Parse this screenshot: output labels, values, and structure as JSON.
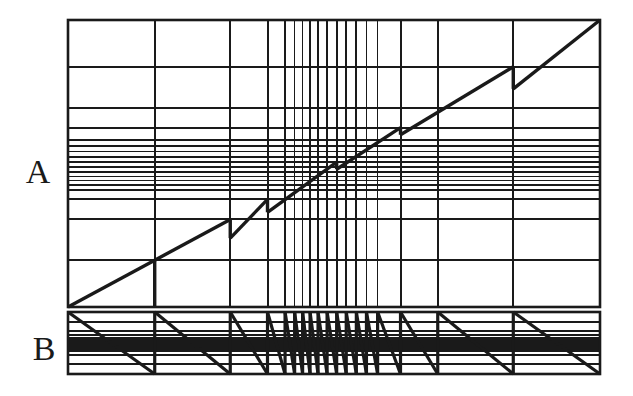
{
  "figure": {
    "background_color": "#ffffff",
    "line_color": "#1a1a1a",
    "canvas": {
      "width": 633,
      "height": 396
    }
  },
  "panels": [
    {
      "id": "A",
      "label": "A",
      "label_x": 38,
      "label_y": 175,
      "box": {
        "x": 68,
        "y": 20,
        "width": 532,
        "height": 287
      },
      "curve_type": "staircase-diagonal",
      "description": "Rising diagonal from lower-left to upper-right broken into segments by vertical drops"
    },
    {
      "id": "B",
      "label": "B",
      "label_x": 44,
      "label_y": 352,
      "box": {
        "x": 68,
        "y": 312,
        "width": 532,
        "height": 62
      },
      "curve_type": "sawtooth",
      "description": "Descending sawtooth ramps with self-similar clustering toward the centre"
    }
  ],
  "chart_data": {
    "type": "line",
    "title": "",
    "xlabel": "",
    "ylabel": "",
    "grid": true,
    "legend": "none",
    "xlim": [
      0,
      1
    ],
    "ylim": [
      0,
      1
    ],
    "gridlines": {
      "note": "Normalised 0-1 positions of the grid lines, shared by both panels for x and used for y in panel A",
      "vertical_x": [
        0.0,
        0.163,
        0.305,
        0.375,
        0.408,
        0.426,
        0.441,
        0.455,
        0.47,
        0.487,
        0.505,
        0.523,
        0.542,
        0.561,
        0.582,
        0.625,
        0.695,
        0.837,
        1.0
      ],
      "horizontal_y": [
        0.0,
        0.163,
        0.305,
        0.375,
        0.408,
        0.426,
        0.441,
        0.455,
        0.47,
        0.487,
        0.505,
        0.523,
        0.542,
        0.561,
        0.582,
        0.625,
        0.695,
        0.837,
        1.0
      ]
    },
    "series": [
      {
        "name": "A",
        "panel": "A",
        "type": "piecewise-linear-staircase",
        "breakpoints_x": [
          0.0,
          0.163,
          0.305,
          0.375,
          0.441,
          0.505,
          0.561,
          0.625,
          0.695,
          0.837,
          1.0
        ],
        "segments": [
          {
            "x0": 0.0,
            "y0": 0.0,
            "x1": 0.163,
            "y1": 0.163,
            "drop_to": 0.0
          },
          {
            "x0": 0.163,
            "y0": 0.163,
            "x1": 0.305,
            "y1": 0.305,
            "drop_to": 0.24
          },
          {
            "x0": 0.305,
            "y0": 0.24,
            "x1": 0.375,
            "y1": 0.375,
            "drop_to": 0.33
          },
          {
            "x0": 0.375,
            "y0": 0.33,
            "x1": 0.505,
            "y1": 0.505,
            "drop_to": 0.48
          },
          {
            "x0": 0.505,
            "y0": 0.48,
            "x1": 0.625,
            "y1": 0.625,
            "drop_to": 0.6
          },
          {
            "x0": 0.625,
            "y0": 0.6,
            "x1": 0.837,
            "y1": 0.837,
            "drop_to": 0.76
          },
          {
            "x0": 0.837,
            "y0": 0.76,
            "x1": 1.0,
            "y1": 1.0,
            "drop_to": 1.0
          }
        ]
      },
      {
        "name": "B",
        "panel": "B",
        "type": "sawtooth",
        "teeth_x": [
          0.0,
          0.163,
          0.305,
          0.375,
          0.408,
          0.426,
          0.441,
          0.455,
          0.47,
          0.487,
          0.505,
          0.523,
          0.542,
          0.561,
          0.582,
          0.625,
          0.695,
          0.837,
          1.0
        ],
        "ramp_direction": "descending"
      }
    ]
  }
}
